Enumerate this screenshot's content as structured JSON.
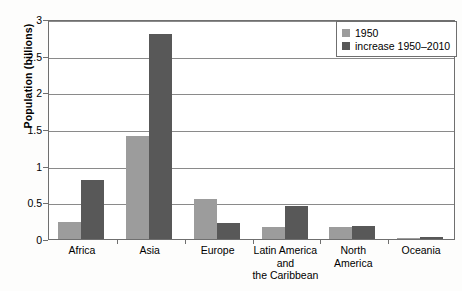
{
  "chart_data": {
    "type": "bar",
    "title": "",
    "xlabel": "",
    "ylabel": "Population (billions)",
    "ylim": [
      0,
      3
    ],
    "yticks": [
      "0",
      "0.5",
      "1",
      "1.5",
      "2",
      "2.5",
      "3"
    ],
    "ytick_values": [
      0,
      0.5,
      1,
      1.5,
      2,
      2.5,
      3
    ],
    "grid": true,
    "legend_position": "top-right",
    "categories": [
      "Africa",
      "Asia",
      "Europe",
      "Latin America and the Caribbean",
      "North America",
      "Oceania"
    ],
    "category_lines": [
      [
        "Africa"
      ],
      [
        "Asia"
      ],
      [
        "Europe"
      ],
      [
        "Latin America",
        "and",
        "the Caribbean"
      ],
      [
        "North",
        "America"
      ],
      [
        "Oceania"
      ]
    ],
    "series": [
      {
        "name": "1950",
        "color": "#9c9c9c",
        "values": [
          0.23,
          1.4,
          0.55,
          0.17,
          0.17,
          0.01
        ]
      },
      {
        "name": "increase 1950–2010",
        "color": "#585858",
        "values": [
          0.8,
          2.8,
          0.22,
          0.45,
          0.18,
          0.03
        ]
      }
    ]
  },
  "legend": {
    "items": [
      {
        "label": "1950",
        "color": "#9c9c9c"
      },
      {
        "label": "increase 1950–2010",
        "color": "#585858"
      }
    ]
  },
  "axis": {
    "y_title": "Population (billions)"
  }
}
